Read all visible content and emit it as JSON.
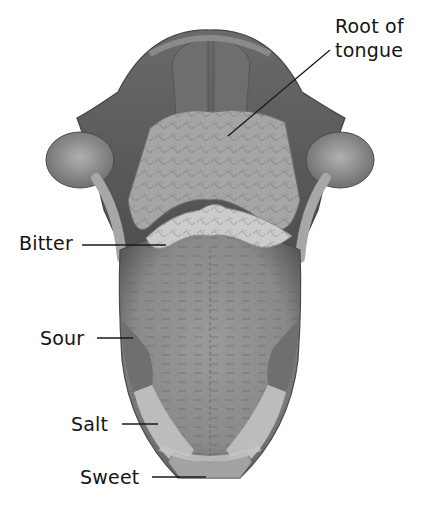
{
  "diagram": {
    "colors": {
      "background": "#ffffff",
      "label_text": "#141414",
      "leader_line": "#1a1a1a",
      "tongue_body": "#8c8c8c",
      "root_papillae": "#a9a9a9",
      "bitter_band": "#c8c8c8",
      "sour_region": "#7a7a7a",
      "salt_region": "#bdbdbd",
      "sweet_region": "#a0a0a0",
      "throat_dark": "#5e5e5e",
      "outline": "#4a4a4a"
    },
    "labels": [
      {
        "id": "root",
        "lines": [
          "Root of",
          "tongue"
        ],
        "x": 335,
        "y": 16,
        "line": [
          330,
          50,
          228,
          136
        ]
      },
      {
        "id": "bitter",
        "text": "Bitter",
        "x": 19,
        "y": 232,
        "line": [
          82,
          245,
          166,
          245
        ]
      },
      {
        "id": "sour",
        "text": "Sour",
        "x": 40,
        "y": 327,
        "line": [
          97,
          338,
          133,
          338
        ]
      },
      {
        "id": "salt",
        "text": "Salt",
        "x": 71,
        "y": 413,
        "line": [
          122,
          424,
          158,
          424
        ]
      },
      {
        "id": "sweet",
        "text": "Sweet",
        "x": 80,
        "y": 466,
        "line": [
          152,
          477,
          206,
          477
        ]
      }
    ]
  }
}
